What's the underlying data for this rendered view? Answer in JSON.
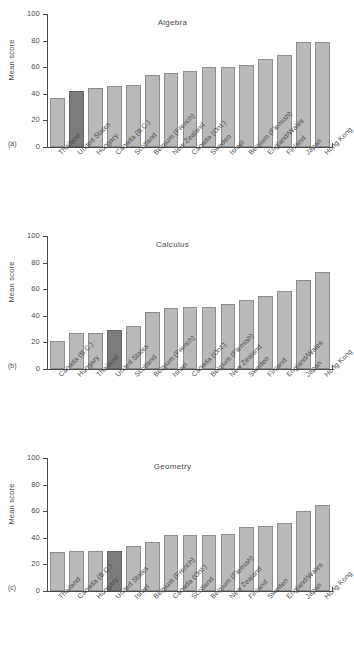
{
  "figure": {
    "y_axis_label": "Mean score",
    "y_ticks": [
      "100",
      "80",
      "60",
      "40",
      "20",
      "0"
    ],
    "panel_tags": [
      "(a)",
      "(b)",
      "(c)"
    ]
  },
  "chart_data": [
    {
      "type": "bar",
      "title": "Algebra",
      "panel_tag": "(a)",
      "xlabel": "",
      "ylabel": "Mean score",
      "ylim": [
        0,
        100
      ],
      "yticks": [
        0,
        20,
        40,
        60,
        80,
        100
      ],
      "grid": false,
      "legend": "none",
      "highlight_category": "United States",
      "categories": [
        "Thailand",
        "United States",
        "Hungary",
        "Canada (B.C.)",
        "Scotland",
        "Belgium (French)",
        "New Zealand",
        "Canada (Ont.)",
        "Sweden",
        "Israel",
        "Belgium (Flemish)",
        "England/Wales",
        "Finland",
        "Japan",
        "Hong Kong"
      ],
      "values": [
        37,
        42,
        44,
        46,
        47,
        54,
        56,
        57,
        60,
        60,
        62,
        66,
        69,
        79,
        79
      ]
    },
    {
      "type": "bar",
      "title": "Calculus",
      "panel_tag": "(b)",
      "xlabel": "",
      "ylabel": "Mean score",
      "ylim": [
        0,
        100
      ],
      "yticks": [
        0,
        20,
        40,
        60,
        80,
        100
      ],
      "grid": false,
      "legend": "none",
      "highlight_category": "United States",
      "categories": [
        "Canada (B.C.)",
        "Hungary",
        "Thailand",
        "United States",
        "Scotland",
        "Belgium (French)",
        "Israel",
        "Canada (Ont.)",
        "Belgium (Flemish)",
        "New Zealand",
        "Sweden",
        "Finland",
        "England/Wales",
        "Japan",
        "Hong Kong"
      ],
      "values": [
        21,
        27,
        27,
        29,
        32,
        43,
        46,
        47,
        47,
        49,
        52,
        55,
        59,
        67,
        73
      ]
    },
    {
      "type": "bar",
      "title": "Geometry",
      "panel_tag": "(c)",
      "xlabel": "",
      "ylabel": "Mean score",
      "ylim": [
        0,
        100
      ],
      "yticks": [
        0,
        20,
        40,
        60,
        80,
        100
      ],
      "grid": false,
      "legend": "none",
      "highlight_category": "United States",
      "categories": [
        "Thailand",
        "Canada (B.C.)",
        "Hungary",
        "United States",
        "Israel",
        "Belgium (French)",
        "Canada (Ont.)",
        "Scotland",
        "Belgium (Flemish)",
        "New Zealand",
        "Finland",
        "Sweden",
        "England/Wales",
        "Japan",
        "Hong Kong"
      ],
      "values": [
        29,
        30,
        30,
        30,
        34,
        37,
        42,
        42,
        42,
        43,
        48,
        49,
        51,
        60,
        65
      ]
    }
  ],
  "colors": {
    "bar_fill": "#b9b9b9",
    "bar_stroke": "#8d8d8d",
    "highlight_fill": "#7b7b7b",
    "highlight_stroke": "#636363",
    "axis": "#4a4a4a",
    "text": "#4a4a4a",
    "background": "#ffffff"
  }
}
